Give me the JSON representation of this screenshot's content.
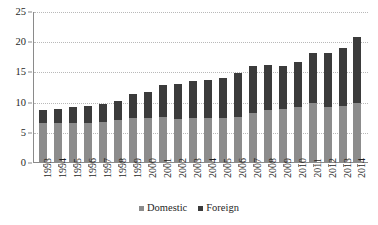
{
  "chart_data": {
    "type": "bar",
    "stacked": true,
    "title": "",
    "subtitle": "",
    "xlabel": "",
    "ylabel": "",
    "ylim": [
      0,
      25
    ],
    "y_ticks": [
      0,
      5,
      10,
      15,
      20,
      25
    ],
    "grid": true,
    "legend_position": "bottom",
    "categories": [
      "1993",
      "1994",
      "1995",
      "1996",
      "1997",
      "1998",
      "1999",
      "2000",
      "2001",
      "2002",
      "2003",
      "2004",
      "2005",
      "2006",
      "2007",
      "2008",
      "2009",
      "2010",
      "2011",
      "2012",
      "2013",
      "2014"
    ],
    "series": [
      {
        "name": "Domestic",
        "color": "#8c8c8c",
        "values": [
          6.6,
          6.6,
          6.6,
          6.7,
          6.8,
          7.1,
          7.4,
          7.4,
          7.7,
          7.3,
          7.4,
          7.5,
          7.5,
          7.7,
          8.3,
          8.8,
          8.9,
          9.2,
          9.9,
          9.3,
          9.5,
          9.9
        ]
      },
      {
        "name": "Foreign",
        "color": "#3b3b3b",
        "values": [
          2.1,
          2.3,
          2.6,
          2.8,
          3.0,
          3.1,
          4.1,
          4.4,
          5.2,
          5.8,
          6.1,
          6.2,
          6.6,
          7.2,
          7.8,
          7.4,
          7.1,
          7.6,
          8.3,
          8.9,
          9.6,
          10.9
        ]
      }
    ],
    "totals": [
      8.7,
      8.9,
      9.2,
      9.5,
      9.8,
      10.2,
      11.5,
      11.8,
      12.9,
      13.1,
      13.5,
      13.7,
      14.1,
      14.9,
      16.1,
      16.2,
      16.0,
      16.8,
      18.2,
      18.2,
      19.1,
      20.8
    ]
  },
  "legend": {
    "entries": [
      {
        "label": "Domestic",
        "color": "#8c8c8c"
      },
      {
        "label": "Foreign",
        "color": "#3b3b3b"
      }
    ]
  }
}
